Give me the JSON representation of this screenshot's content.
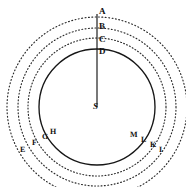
{
  "figure": {
    "background_color": "#ffffff",
    "ink_color": "#121212",
    "center": {
      "x": 97,
      "y": 107,
      "label": "S"
    }
  },
  "circles": [
    {
      "id": "orbit-solid",
      "name": "solid-orbit-circle",
      "radius": 58,
      "style": "solid",
      "axis_label": "D"
    },
    {
      "id": "ring-1",
      "name": "dotted-arc-inner",
      "radius": 69,
      "style": "dotted",
      "axis_label": "C"
    },
    {
      "id": "ring-2",
      "name": "dotted-arc-middle",
      "radius": 79,
      "style": "dotted",
      "axis_label": "B"
    },
    {
      "id": "ring-3",
      "name": "dotted-arc-outer",
      "radius": 90,
      "style": "dotted",
      "axis_label": "A"
    }
  ],
  "radial_line": {
    "name": "radial-line-from-center",
    "from": {
      "x": 97,
      "y": 107
    },
    "to": {
      "x": 97,
      "y": 14
    }
  },
  "labels": {
    "axis": [
      {
        "text": "A",
        "x": 99,
        "y": 7
      },
      {
        "text": "B",
        "x": 99,
        "y": 22
      },
      {
        "text": "C",
        "x": 99,
        "y": 35
      },
      {
        "text": "D",
        "x": 99,
        "y": 47
      }
    ],
    "center": [
      {
        "text": "S",
        "x": 93,
        "y": 102
      }
    ],
    "left_ring": [
      {
        "text": "E",
        "x": 20,
        "y": 146
      },
      {
        "text": "F",
        "x": 32,
        "y": 139
      },
      {
        "text": "G",
        "x": 42,
        "y": 133
      },
      {
        "text": "H",
        "x": 50,
        "y": 128
      }
    ],
    "right_ring": [
      {
        "text": "M",
        "x": 130,
        "y": 131
      },
      {
        "text": "L",
        "x": 141,
        "y": 136
      },
      {
        "text": "K",
        "x": 150,
        "y": 141
      },
      {
        "text": "I",
        "x": 159,
        "y": 146
      }
    ]
  }
}
